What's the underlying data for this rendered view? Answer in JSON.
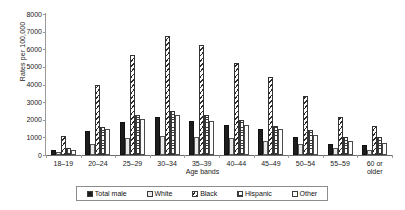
{
  "chart_data": {
    "type": "bar",
    "title": "",
    "xlabel": "Age bands",
    "ylabel": "Rates per 100,000",
    "ylim": [
      0,
      8000
    ],
    "ytick_step": 1000,
    "grid": false,
    "legend_position": "bottom",
    "categories": [
      "18–19",
      "20–24",
      "25–29",
      "30–34",
      "35–39",
      "40–44",
      "45–49",
      "50–54",
      "55–59",
      "60 or older"
    ],
    "yticks": [
      "0",
      "1000",
      "2000",
      "3000",
      "4000",
      "5000",
      "6000",
      "7000",
      "8000"
    ],
    "series": [
      {
        "name": "Total male",
        "pattern": "solid-black",
        "values": [
          300,
          1350,
          1900,
          2150,
          1950,
          1700,
          1450,
          1050,
          650,
          550
        ]
      },
      {
        "name": "White",
        "pattern": "plain-light",
        "values": [
          150,
          600,
          950,
          1100,
          1000,
          950,
          800,
          600,
          400,
          300
        ]
      },
      {
        "name": "Black",
        "pattern": "diagonal-hatch",
        "values": [
          1100,
          3950,
          5700,
          6750,
          6250,
          5200,
          4450,
          3350,
          2150,
          1650
        ]
      },
      {
        "name": "Hispanic",
        "pattern": "checkered-dots",
        "values": [
          400,
          1600,
          2250,
          2500,
          2250,
          2000,
          1650,
          1400,
          1000,
          1000
        ]
      },
      {
        "name": "Other",
        "pattern": "white-outline",
        "values": [
          300,
          1500,
          2050,
          2250,
          1950,
          1700,
          1500,
          1150,
          800,
          700
        ]
      }
    ]
  },
  "legend": {
    "items": [
      {
        "label": "Total male"
      },
      {
        "label": "White"
      },
      {
        "label": "Black"
      },
      {
        "label": "Hispanic"
      },
      {
        "label": "Other"
      }
    ]
  },
  "colors": {
    "total_male": "#1d1d1d",
    "white": "#eceaea",
    "black_hatch": "#2b2b2b",
    "hispanic_dots": "#3a3a3a",
    "other": "#fcfcfc",
    "axis": "#9a9a9a",
    "text": "#1a1a1a"
  }
}
